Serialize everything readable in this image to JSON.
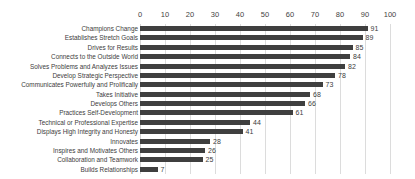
{
  "chart_data": {
    "type": "bar",
    "orientation": "horizontal",
    "title": "",
    "subtitle": "",
    "xlabel": "",
    "ylabel": "",
    "xlim": [
      0,
      100
    ],
    "xticks": [
      0,
      10,
      20,
      30,
      40,
      50,
      60,
      70,
      80,
      90,
      100
    ],
    "xtick_labels": [
      "0",
      "10",
      "20",
      "30",
      "40",
      "50",
      "60",
      "70",
      "80",
      "90",
      "100"
    ],
    "grid": "vertical",
    "axis_position": "top",
    "legend": null,
    "legend_position": "none",
    "bar_color": "#3f3f3f",
    "gridline_color": "#dcdcdc",
    "background_color": "#ffffff",
    "data_labels": true,
    "categories": [
      "Champions Change",
      "Establishes Stretch Goals",
      "Drives for Results",
      "Connects to the Outside World",
      "Solves Problems and Analyzes Issues",
      "Develop Strategic Perspective",
      "Communicates Powerfully and Prolifically",
      "Takes Initiative",
      "Develops Others",
      "Practices Self-Development",
      "Technical or Professional Expertise",
      "Displays High Integrity and Honesty",
      "Innovates",
      "Inspires and Motivates Others",
      "Collaboration and Teamwork",
      "Builds Relationships"
    ],
    "values": [
      91,
      89,
      85,
      84,
      82,
      78,
      73,
      68,
      66,
      61,
      44,
      41,
      28,
      26,
      25,
      7
    ],
    "value_labels": [
      "91",
      "89",
      "85",
      "84",
      "82",
      "78",
      "73",
      "68",
      "66",
      "61",
      "44",
      "41",
      "28",
      "26",
      "25",
      "7"
    ]
  }
}
